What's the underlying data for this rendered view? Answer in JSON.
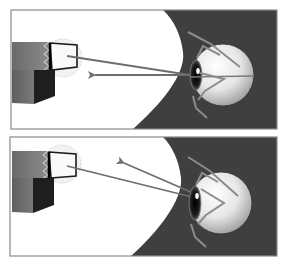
{
  "figure": {
    "colors": {
      "background": "#ffffff",
      "dark_region": "#3f3f3f",
      "panel_border": "#8a8a8a",
      "ray": "#6e6e6e",
      "eyelid": "#8c8c8c",
      "box_front": "#707070",
      "box_side": "#1e1e1e",
      "eyeball_light": "#f4f4f4",
      "eyeball_shade": "#9a9a9a"
    },
    "panels": [
      {
        "id": "top",
        "label": "",
        "rays": [
          {
            "kind": "line",
            "from": [
              67,
              56
            ],
            "to": [
              203,
              77
            ]
          },
          {
            "kind": "arrow",
            "from": [
              203,
              74
            ],
            "to": [
              88,
              74
            ],
            "direction": "left"
          }
        ],
        "optical_axis": true
      },
      {
        "id": "bottom",
        "label": "",
        "rays": [
          {
            "kind": "line",
            "from": [
              67,
              176
            ],
            "to": [
              200,
              209
            ]
          },
          {
            "kind": "arrow",
            "from": [
              200,
              206
            ],
            "to": [
              118,
              160
            ],
            "direction": "up-left"
          }
        ],
        "optical_axis": false
      }
    ]
  }
}
